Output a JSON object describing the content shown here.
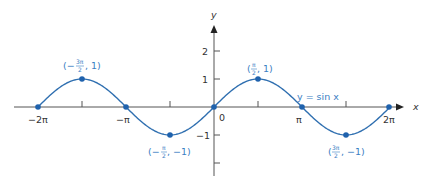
{
  "chart_data": {
    "type": "line",
    "title": "",
    "xlabel": "x",
    "ylabel": "y",
    "function_label": "y = sin x",
    "xlim": [
      -6.9,
      7.3
    ],
    "ylim": [
      -2.2,
      2.6
    ],
    "grid": false,
    "legend": "none",
    "x_tick_labels": [
      "−2π",
      "−π",
      "0",
      "π",
      "2π"
    ],
    "x_tick_values": [
      -6.2832,
      -3.1416,
      0,
      3.1416,
      6.2832
    ],
    "x_minor_ticks": [
      -4.7124,
      -1.5708,
      1.5708,
      4.7124
    ],
    "y_tick_labels": [
      "2",
      "1",
      "−1"
    ],
    "y_tick_values": [
      2,
      1,
      -1
    ],
    "y_minor_ticks": [
      -2
    ],
    "series": [
      {
        "name": "y = sin x",
        "function": "sin(x)",
        "x_range": [
          -6.2832,
          6.2832
        ],
        "color": "#2f6fb0"
      }
    ],
    "marked_points": [
      {
        "x": -6.2832,
        "y": 0,
        "label": ""
      },
      {
        "x": -4.7124,
        "y": 1,
        "label": "(−3π/2, 1)"
      },
      {
        "x": -3.1416,
        "y": 0,
        "label": ""
      },
      {
        "x": -1.5708,
        "y": -1,
        "label": "(−π/2, −1)"
      },
      {
        "x": 0,
        "y": 0,
        "label": ""
      },
      {
        "x": 1.5708,
        "y": 1,
        "label": "(π/2, 1)"
      },
      {
        "x": 3.1416,
        "y": 0,
        "label": ""
      },
      {
        "x": 4.7124,
        "y": -1,
        "label": "(3π/2, −1)"
      },
      {
        "x": 6.2832,
        "y": 0,
        "label": ""
      }
    ]
  },
  "labels": {
    "x_axis": "x",
    "y_axis": "y",
    "func": "y = sin x",
    "xt_m2pi": "−2π",
    "xt_mpi": "−π",
    "xt_0": "0",
    "xt_pi": "π",
    "xt_2pi": "2π",
    "yt_2": "2",
    "yt_1": "1",
    "yt_m1": "−1",
    "p1_open": "(−",
    "p1_num": "3π",
    "p1_den": "2",
    "p1_close": ", 1)",
    "p2_open": "(−",
    "p2_num": "π",
    "p2_den": "2",
    "p2_close": ", −1)",
    "p3_open": "(",
    "p3_num": "π",
    "p3_den": "2",
    "p3_close": ", 1)",
    "p4_open": "(",
    "p4_num": "3π",
    "p4_den": "2",
    "p4_close": ", −1)"
  }
}
